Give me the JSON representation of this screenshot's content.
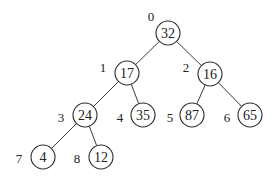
{
  "diagram": {
    "type": "binary-heap-tree",
    "node_radius": 12,
    "colors": {
      "background": "#ffffff",
      "stroke": "#2e2e2e",
      "text": "#222222"
    },
    "nodes": [
      {
        "index": "0",
        "value": "32",
        "cx": 168,
        "cy": 33,
        "lx": 151,
        "ly": 16
      },
      {
        "index": "1",
        "value": "17",
        "cx": 127,
        "cy": 73,
        "lx": 103,
        "ly": 67
      },
      {
        "index": "2",
        "value": "16",
        "cx": 210,
        "cy": 74,
        "lx": 186,
        "ly": 67
      },
      {
        "index": "3",
        "value": "24",
        "cx": 85,
        "cy": 115,
        "lx": 61,
        "ly": 117
      },
      {
        "index": "4",
        "value": "35",
        "cx": 143,
        "cy": 115,
        "lx": 120,
        "ly": 117
      },
      {
        "index": "5",
        "value": "87",
        "cx": 192,
        "cy": 115,
        "lx": 170,
        "ly": 117
      },
      {
        "index": "6",
        "value": "65",
        "cx": 250,
        "cy": 115,
        "lx": 227,
        "ly": 117
      },
      {
        "index": "7",
        "value": "4",
        "cx": 43,
        "cy": 157,
        "lx": 19,
        "ly": 158
      },
      {
        "index": "8",
        "value": "12",
        "cx": 101,
        "cy": 157,
        "lx": 77,
        "ly": 158
      }
    ],
    "edges": [
      [
        "0",
        "1"
      ],
      [
        "0",
        "2"
      ],
      [
        "1",
        "3"
      ],
      [
        "1",
        "4"
      ],
      [
        "2",
        "5"
      ],
      [
        "2",
        "6"
      ],
      [
        "3",
        "7"
      ],
      [
        "3",
        "8"
      ]
    ]
  }
}
